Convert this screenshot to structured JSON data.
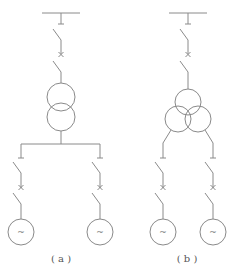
{
  "diagram": {
    "type": "electrical single-line diagram",
    "panels": [
      {
        "id": "a",
        "label": "( a )",
        "transformer": "two-winding",
        "branches": 2,
        "generator_symbol": "~"
      },
      {
        "id": "b",
        "label": "( b )",
        "transformer": "three-winding",
        "branches": 2,
        "generator_symbol": "~"
      }
    ],
    "colors": {
      "line": "#8a8a8a",
      "text": "#555555",
      "background": "#ffffff"
    }
  }
}
